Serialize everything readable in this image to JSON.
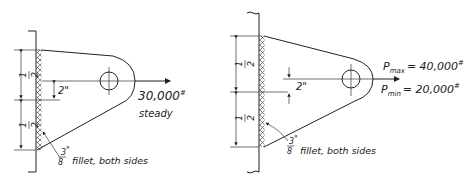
{
  "figures": [
    {
      "id": "left",
      "dim_upper": {
        "num": "1",
        "den": "2"
      },
      "dim_lower": {
        "num": "1",
        "den": "2"
      },
      "offset_label": "2\"",
      "load_label": "30,000",
      "load_unit": "#",
      "load_note": "steady",
      "weld_size": {
        "num": "3",
        "den": "8",
        "mark": "\""
      },
      "weld_note": "fillet, both sides"
    },
    {
      "id": "right",
      "dim_upper": {
        "num": "1",
        "den": "2"
      },
      "dim_lower": {
        "num": "1",
        "den": "2"
      },
      "offset_label": "2\"",
      "pmax": {
        "symbol": "P",
        "sub": "max",
        "eq": "= 40,000",
        "unit": "#"
      },
      "pmin": {
        "symbol": "P",
        "sub": "min",
        "eq": "= 20,000",
        "unit": "#"
      },
      "weld_size": {
        "num": "3",
        "den": "8",
        "mark": "\""
      },
      "weld_note": "fillet, both sides"
    }
  ]
}
